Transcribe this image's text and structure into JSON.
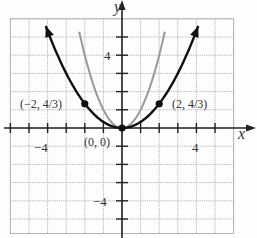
{
  "chart_data": {
    "type": "line",
    "title": "",
    "xlabel": "x",
    "ylabel": "y",
    "xlim": [
      -6,
      6
    ],
    "ylim": [
      -5.8,
      6
    ],
    "grid": true,
    "ticks": {
      "x_labels": [
        "-4",
        "4"
      ],
      "y_labels": [
        "4",
        "-4"
      ]
    },
    "series": [
      {
        "name": "y = x^2/3",
        "color": "#111111",
        "function": "x^2/3",
        "domain": [
          -4.1,
          4.1
        ],
        "arrows": true
      },
      {
        "name": "y = x^2",
        "color": "#999999",
        "function": "x^2",
        "domain": [
          -2.3,
          2.3
        ],
        "arrows": false
      }
    ],
    "points": [
      {
        "x": -2,
        "y": 1.3333,
        "label": "(−2, 4/3)"
      },
      {
        "x": 0,
        "y": 0,
        "label": "(0, 0)"
      },
      {
        "x": 2,
        "y": 1.3333,
        "label": "(2, 4/3)"
      }
    ]
  },
  "labels": {
    "x_axis": "x",
    "y_axis": "y",
    "x_tick_neg4": "−4",
    "x_tick_pos4": "4",
    "y_tick_pos4": "4",
    "y_tick_neg4": "−4",
    "pt_left": "(−2, 4/3)",
    "pt_origin": "(0, 0)",
    "pt_right": "(2, 4/3)"
  }
}
